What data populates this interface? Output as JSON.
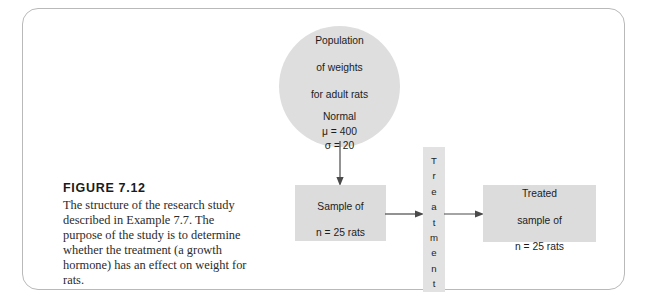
{
  "figure": {
    "caption_title": "FIGURE 7.12",
    "caption_body": "The structure of the research study described in Example 7.7. The purpose of the study is to determine whether the treatment (a growth hormone) has an effect on weight for rats."
  },
  "diagram": {
    "population": {
      "line1": "Population",
      "line2": "of weights",
      "line3": "for adult rats",
      "distribution": "Normal",
      "mu": "μ = 400",
      "sigma": "σ = 20"
    },
    "sample": {
      "line1": "Sample of",
      "line2": "n = 25 rats"
    },
    "treatment": {
      "label": "Treatment",
      "chars": [
        "T",
        "r",
        "e",
        "a",
        "t",
        "m",
        "e",
        "n",
        "t"
      ]
    },
    "treated_sample": {
      "line1": "Treated",
      "line2": "sample of",
      "line3": "n = 25 rats"
    },
    "arrows": {
      "population_to_sample": "arrow-down",
      "sample_to_treatment": "arrow-right",
      "treatment_to_treated": "arrow-right"
    }
  },
  "colors": {
    "frame_border": "#b9b9b9",
    "shape_fill": "#dcdcdc",
    "circle_fill": "#dedede",
    "treatment_fill": "#e2e2e2",
    "arrow": "#4a4a4a",
    "text": "#1c1c1c",
    "background": "#ffffff"
  }
}
